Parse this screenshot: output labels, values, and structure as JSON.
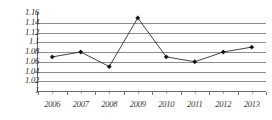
{
  "chart_data": {
    "type": "line",
    "title": "",
    "subtitle": "",
    "xlabel": "",
    "ylabel": "",
    "categories": [
      "2006",
      "2007",
      "2008",
      "2009",
      "2010",
      "2011",
      "2012",
      "2013"
    ],
    "values": [
      1.07,
      1.08,
      1.05,
      1.15,
      1.07,
      1.06,
      1.08,
      1.09
    ],
    "series": [
      {
        "name": "",
        "values": [
          1.07,
          1.08,
          1.05,
          1.15,
          1.07,
          1.06,
          1.08,
          1.09
        ]
      }
    ],
    "ylim": [
      1,
      1.16
    ],
    "xlim": [
      "2006",
      "2013"
    ],
    "y_ticks": [
      1.16,
      1.14,
      1.12,
      1.1,
      1.08,
      1.06,
      1.04,
      1.02,
      1
    ],
    "y_tick_labels": [
      "1.16",
      "1.14",
      "1.12",
      "1.1",
      "1.08",
      "1.06",
      "1.04",
      "1.02",
      "1"
    ],
    "x_tick_labels": [
      "2006",
      "2007",
      "2008",
      "2009",
      "2010",
      "2011",
      "2012",
      "2013"
    ],
    "grid": {
      "horizontal": true,
      "vertical": false
    },
    "legend": {
      "visible": false,
      "position": "none",
      "entries": []
    },
    "annotations": [],
    "style": {
      "line_color": "#2f2f2f",
      "marker_color": "#111111",
      "marker_shape": "diamond",
      "gridline_color": "#8d8d8d",
      "axis_color": "#6a6a6a",
      "background_color": "#ffffff",
      "tick_label_color": "#2b2b2b"
    }
  }
}
